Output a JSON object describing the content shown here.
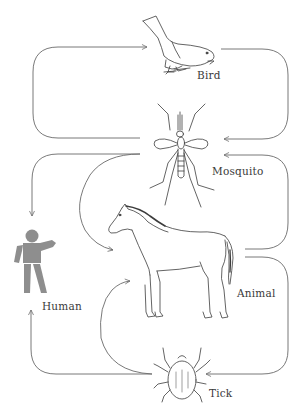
{
  "diagram": {
    "type": "transmission-cycle",
    "colors": {
      "line": "#6a6a6a",
      "drawing": "#3c3c3c",
      "human_fill": "#8e8e8e",
      "background": "#ffffff"
    },
    "nodes": {
      "bird": {
        "label": "Bird"
      },
      "mosquito": {
        "label": "Mosquito"
      },
      "human": {
        "label": "Human"
      },
      "animal": {
        "label": "Animal"
      },
      "tick": {
        "label": "Tick"
      }
    },
    "edges": [
      {
        "from": "Mosquito",
        "to": "Bird"
      },
      {
        "from": "Bird",
        "to": "Mosquito"
      },
      {
        "from": "Mosquito",
        "to": "Human"
      },
      {
        "from": "Mosquito",
        "to": "Animal"
      },
      {
        "from": "Animal",
        "to": "Mosquito"
      },
      {
        "from": "Tick",
        "to": "Human"
      },
      {
        "from": "Tick",
        "to": "Animal"
      },
      {
        "from": "Animal",
        "to": "Tick"
      }
    ]
  }
}
